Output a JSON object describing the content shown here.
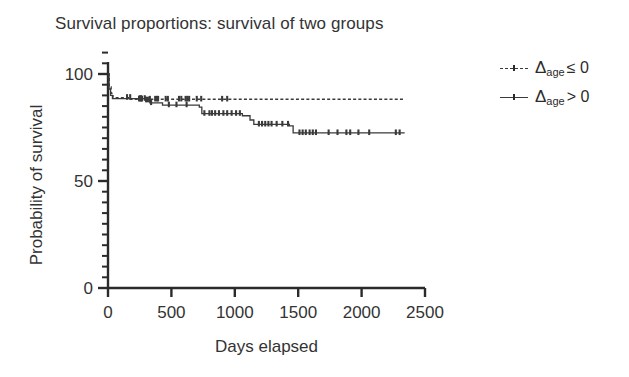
{
  "chart_data": {
    "type": "line",
    "title": "Survival proportions: survival of two groups",
    "xlabel": "Days elapsed",
    "ylabel": "Probability of survival",
    "xlim": [
      0,
      2500
    ],
    "ylim": [
      0,
      110
    ],
    "grid": false,
    "legend_position": "right",
    "xticks": [
      0,
      500,
      1000,
      1500,
      2000,
      2500
    ],
    "yticks": [
      0,
      50,
      100
    ],
    "yminor_step": 5,
    "series": [
      {
        "name": "delta_age_le_0",
        "legend_text": "Δage ≤ 0",
        "legend_symbol": "Δ",
        "legend_subscript": "age",
        "legend_operator": "≤ 0",
        "style": "dashed",
        "points": [
          [
            0,
            100
          ],
          [
            10,
            100
          ],
          [
            10,
            94
          ],
          [
            25,
            94
          ],
          [
            25,
            91
          ],
          [
            40,
            91
          ],
          [
            40,
            89
          ],
          [
            180,
            89
          ],
          [
            180,
            88.2
          ],
          [
            2340,
            88.2
          ]
        ],
        "censor_marks": [
          150,
          175,
          245,
          255,
          262,
          268,
          330,
          372,
          385,
          395,
          455,
          472,
          560,
          578,
          612,
          625,
          640,
          700,
          735,
          900,
          940
        ]
      },
      {
        "name": "delta_age_gt_0",
        "legend_text": "Δage > 0",
        "legend_symbol": "Δ",
        "legend_subscript": "age",
        "legend_operator": "> 0",
        "style": "solid",
        "points": [
          [
            0,
            100
          ],
          [
            8,
            100
          ],
          [
            8,
            93
          ],
          [
            20,
            93
          ],
          [
            20,
            90
          ],
          [
            35,
            90
          ],
          [
            35,
            88.5
          ],
          [
            300,
            88.5
          ],
          [
            300,
            87.8
          ],
          [
            330,
            87.8
          ],
          [
            330,
            86.5
          ],
          [
            430,
            86.5
          ],
          [
            430,
            85.5
          ],
          [
            720,
            85.5
          ],
          [
            720,
            84.5
          ],
          [
            740,
            84.5
          ],
          [
            740,
            81.5
          ],
          [
            1060,
            81.5
          ],
          [
            1060,
            80.5
          ],
          [
            1120,
            80.5
          ],
          [
            1120,
            78.5
          ],
          [
            1150,
            78.5
          ],
          [
            1150,
            76.5
          ],
          [
            1430,
            76.5
          ],
          [
            1430,
            75.8
          ],
          [
            1460,
            75.8
          ],
          [
            1460,
            72.5
          ],
          [
            2340,
            72.5
          ]
        ],
        "censor_marks": [
          250,
          262,
          290,
          300,
          312,
          325,
          340,
          480,
          540,
          620,
          760,
          800,
          820,
          845,
          875,
          910,
          940,
          975,
          1010,
          1040,
          1190,
          1215,
          1240,
          1265,
          1290,
          1330,
          1375,
          1420,
          1510,
          1535,
          1560,
          1590,
          1615,
          1640,
          1740,
          1810,
          1880,
          1910,
          1975,
          2060,
          2270,
          2300
        ]
      }
    ]
  },
  "axes": {
    "x_tick_labels": [
      "0",
      "500",
      "1000",
      "1500",
      "2000",
      "2500"
    ],
    "y_tick_labels": [
      "0",
      "50",
      "100"
    ]
  },
  "colors": {
    "line": "#3a3a3a",
    "axis": "#2b2b2b",
    "text": "#333333",
    "background": "#ffffff"
  }
}
